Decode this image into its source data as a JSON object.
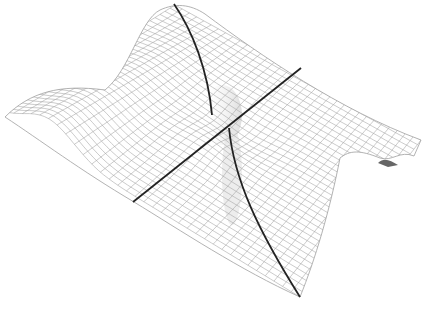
{
  "figure": {
    "type": "3d-wireframe-surface",
    "colors": {
      "background": "#ffffff",
      "mesh": "#9a9a9a",
      "shade": "#d9d9d9",
      "curve": "#222222"
    },
    "curves": [
      {
        "name": "straight-line",
        "from": [
          133,
          202
        ],
        "to": [
          301,
          68
        ]
      },
      {
        "name": "curved-line-upper",
        "points": [
          [
            174,
            4
          ],
          [
            196,
            40
          ],
          [
            210,
            80
          ],
          [
            212,
            115
          ]
        ]
      },
      {
        "name": "curved-line-lower",
        "points": [
          [
            229,
            128
          ],
          [
            236,
            170
          ],
          [
            258,
            225
          ],
          [
            300,
            297
          ]
        ]
      }
    ]
  }
}
